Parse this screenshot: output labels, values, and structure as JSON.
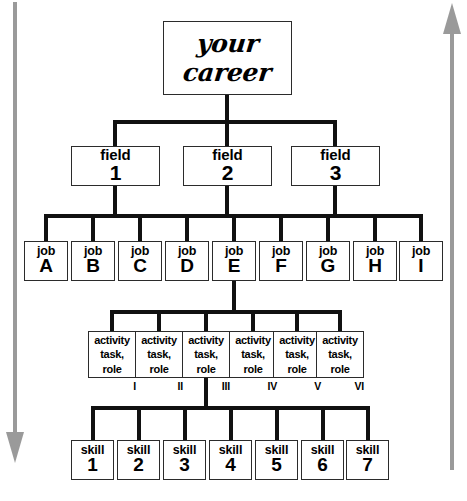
{
  "diagram": {
    "title_box": {
      "line1": "your",
      "line2": "career"
    },
    "left_arrow": {
      "name": "downward-arrow",
      "direction": "down",
      "color": "#9a9a9a"
    },
    "right_arrow": {
      "name": "upward-arrow",
      "direction": "up",
      "color": "#9a9a9a"
    },
    "levels": {
      "fields": {
        "label": "field",
        "items": [
          {
            "label": "field",
            "value": "1"
          },
          {
            "label": "field",
            "value": "2"
          },
          {
            "label": "field",
            "value": "3"
          }
        ]
      },
      "jobs": {
        "label": "job",
        "items": [
          {
            "label": "job",
            "value": "A"
          },
          {
            "label": "job",
            "value": "B"
          },
          {
            "label": "job",
            "value": "C"
          },
          {
            "label": "job",
            "value": "D"
          },
          {
            "label": "job",
            "value": "E"
          },
          {
            "label": "job",
            "value": "F"
          },
          {
            "label": "job",
            "value": "G"
          },
          {
            "label": "job",
            "value": "H"
          },
          {
            "label": "job",
            "value": "I"
          }
        ]
      },
      "activities": {
        "line1": "activity",
        "line2": "task,",
        "line3": "role",
        "items": [
          {
            "line1": "activity",
            "line2": "task,",
            "line3": "role",
            "numeral": "I"
          },
          {
            "line1": "activity",
            "line2": "task,",
            "line3": "role",
            "numeral": "II"
          },
          {
            "line1": "activity",
            "line2": "task,",
            "line3": "role",
            "numeral": "III"
          },
          {
            "line1": "activity",
            "line2": "task,",
            "line3": "role",
            "numeral": "IV"
          },
          {
            "line1": "activity",
            "line2": "task,",
            "line3": "role",
            "numeral": "V"
          },
          {
            "line1": "activity",
            "line2": "task,",
            "line3": "role",
            "numeral": "VI"
          }
        ]
      },
      "skills": {
        "label": "skill",
        "items": [
          {
            "label": "skill",
            "value": "1"
          },
          {
            "label": "skill",
            "value": "2"
          },
          {
            "label": "skill",
            "value": "3"
          },
          {
            "label": "skill",
            "value": "4"
          },
          {
            "label": "skill",
            "value": "5"
          },
          {
            "label": "skill",
            "value": "6"
          },
          {
            "label": "skill",
            "value": "7"
          }
        ]
      }
    },
    "colors": {
      "box_border": "#2b2b2b",
      "connector": "#111111",
      "arrow": "#9a9a9a",
      "background": "#ffffff"
    }
  }
}
